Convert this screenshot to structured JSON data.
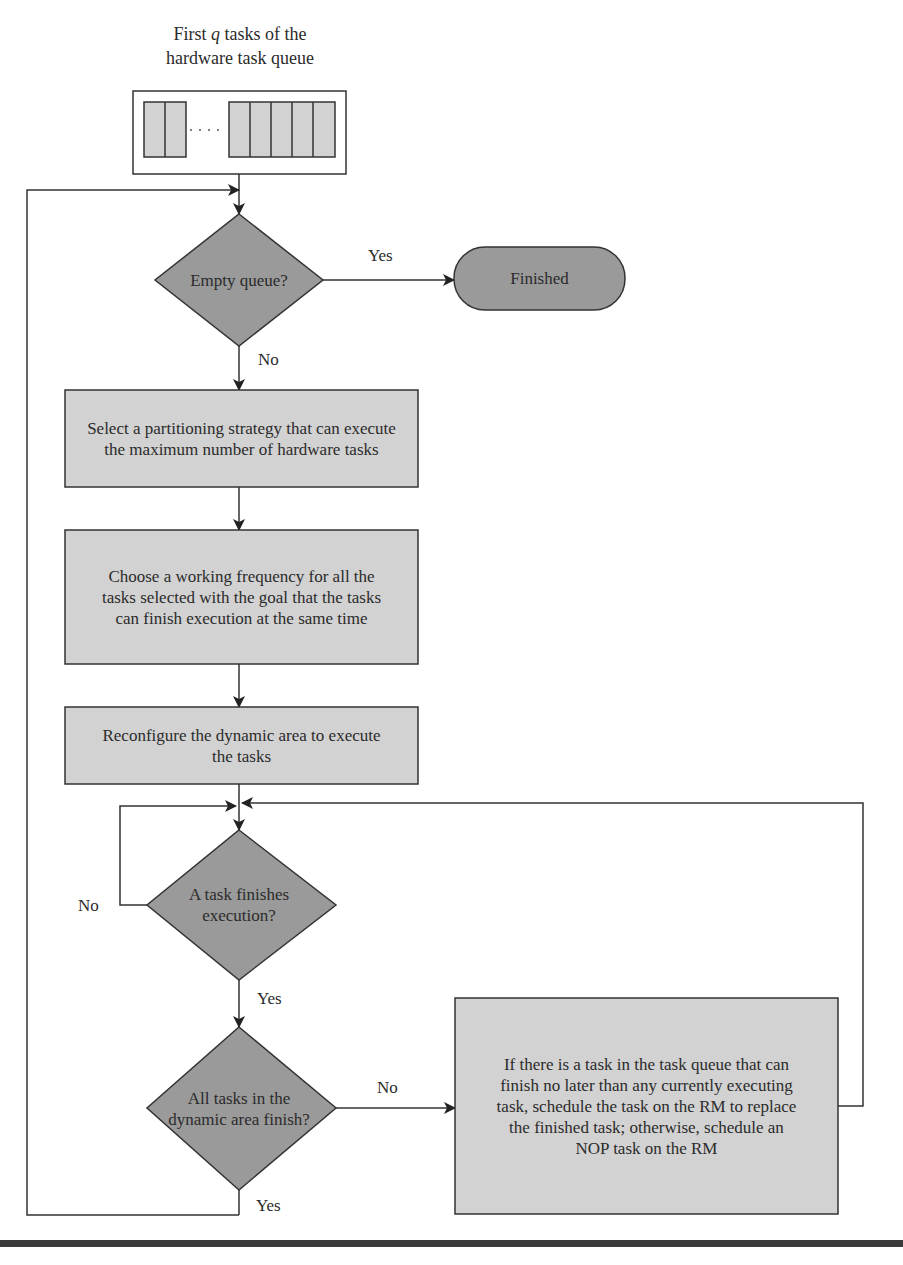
{
  "figure": {
    "queue_caption_line1": "First ",
    "queue_caption_q": "q",
    "queue_caption_line1_rest": " tasks of the",
    "queue_caption_line2": "hardware task queue",
    "queue": {
      "left_cells": 2,
      "right_cells": 5,
      "ellipsis": "· · · ·"
    },
    "colors": {
      "box_fill": "#d2d2d2",
      "decision_fill": "#9a9a9a",
      "terminal_fill": "#9a9a9a",
      "stroke": "#333333",
      "rule": "#3a3a3a"
    }
  },
  "nodes": {
    "empty_queue": "Empty queue?",
    "finished": "Finished",
    "select_strategy": "Select a partitioning strategy that can execute the maximum number of hardware tasks",
    "choose_frequency": "Choose a working frequency for all the tasks selected with the goal that the tasks can finish execution at the same time",
    "reconfigure": "Reconfigure the dynamic area to execute the tasks",
    "task_finishes": "A task finishes execution?",
    "all_finish": "All tasks in the dynamic area finish?",
    "schedule": "If there is a task in the task queue that can finish no later than any currently executing task, schedule the task on the RM to replace the finished task; otherwise, schedule an NOP task on the RM"
  },
  "edges": {
    "empty_yes": "Yes",
    "empty_no": "No",
    "task_no": "No",
    "task_yes": "Yes",
    "all_no": "No",
    "all_yes": "Yes"
  }
}
